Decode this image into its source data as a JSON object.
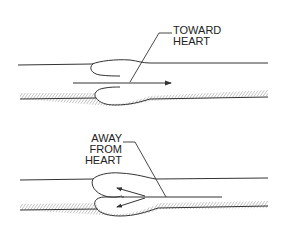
{
  "diagram": {
    "title": "",
    "colors": {
      "stroke": "#333333",
      "hatch": "#777777",
      "background": "#ffffff"
    },
    "panels": [
      {
        "id": "top",
        "label_lines": [
          "TOWARD",
          "HEART"
        ],
        "description": "Vein valve open; blood flows toward heart (arrow pointing right)",
        "arrow_direction": "right"
      },
      {
        "id": "bottom",
        "label_lines": [
          "AWAY FROM",
          "HEART"
        ],
        "description": "Vein valve closed; backflow away from heart fills valve cusps (arrows pointing left)",
        "arrow_direction": "left"
      }
    ]
  }
}
